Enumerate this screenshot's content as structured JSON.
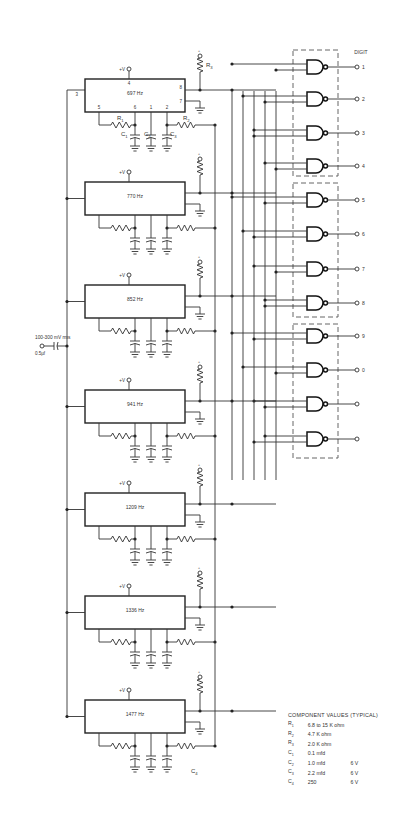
{
  "diagram": {
    "type": "circuit-schematic",
    "input": {
      "label": "100-300 mV rms",
      "capacitor_label": "0.5µf"
    },
    "supply_label": "+V",
    "pins": {
      "p4": "4",
      "p8": "8",
      "p7": "7",
      "p3": "3",
      "p5": "5",
      "p6": "6",
      "p1": "1",
      "p2": "2"
    },
    "component_refs": {
      "R1": "R",
      "R1_sub": "1",
      "R2": "R",
      "R2_sub": "2",
      "R3": "R",
      "R3_sub": "3",
      "C1": "C",
      "C1_sub": "1",
      "C2": "C",
      "C2_sub": "2",
      "C3": "C",
      "C3_sub": "3",
      "C4": "C",
      "C4_sub": "4"
    },
    "tone_decoders": [
      {
        "label": "697 Hz"
      },
      {
        "label": "770 Hz"
      },
      {
        "label": "852 Hz"
      },
      {
        "label": "941 Hz"
      },
      {
        "label": "1209 Hz"
      },
      {
        "label": "1336 Hz"
      },
      {
        "label": "1477 Hz"
      }
    ],
    "outputs": {
      "header": "DIGIT",
      "digits": [
        "1",
        "2",
        "3",
        "4",
        "5",
        "6",
        "7",
        "8",
        "9",
        "0",
        "",
        ""
      ]
    },
    "gate_type": "NAND",
    "component_values": {
      "title": "COMPONENT VALUES (TYPICAL)",
      "rows": [
        {
          "ref": "R",
          "sub": "1",
          "value": "6.8 to 15 K ohm",
          "rating": ""
        },
        {
          "ref": "R",
          "sub": "2",
          "value": "4.7 K ohm",
          "rating": ""
        },
        {
          "ref": "R",
          "sub": "3",
          "value": "2.0 K ohm",
          "rating": ""
        },
        {
          "ref": "C",
          "sub": "1",
          "value": "0.1 mfd",
          "rating": ""
        },
        {
          "ref": "C",
          "sub": "2",
          "value": "1.0 mfd",
          "rating": "6 V"
        },
        {
          "ref": "C",
          "sub": "3",
          "value": "2.2 mfd",
          "rating": "6 V"
        },
        {
          "ref": "C",
          "sub": "4",
          "value": "250",
          "rating": "6 V"
        }
      ]
    }
  }
}
